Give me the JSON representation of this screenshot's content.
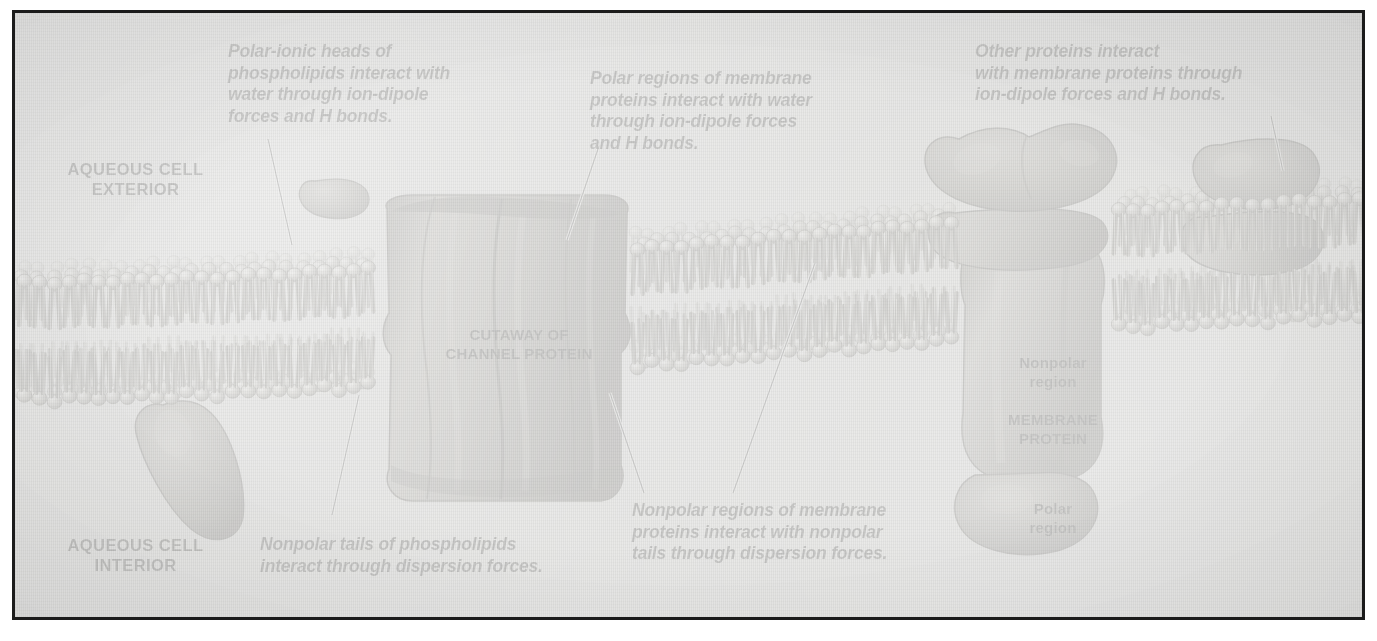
{
  "figure": {
    "background_color": "#e3e3e1",
    "frame_color": "#1b1b1b",
    "ink_color": "#0a0a0a"
  },
  "region_labels": {
    "exterior": "AQUEOUS CELL\nEXTERIOR",
    "interior": "AQUEOUS CELL\nINTERIOR"
  },
  "structure_labels": {
    "channel_protein": "CUTAWAY OF\nCHANNEL PROTEIN",
    "membrane_protein": "MEMBRANE\nPROTEIN",
    "nonpolar_region": "Nonpolar\nregion",
    "polar_region": "Polar\nregion"
  },
  "captions": [
    {
      "id": "polar-ionic-heads",
      "text": "Polar-ionic heads of\nphospholipids interact with\nwater through ion-dipole\nforces and H bonds."
    },
    {
      "id": "polar-regions-proteins",
      "text": "Polar regions of membrane\nproteins interact with water\nthrough ion-dipole forces\nand H bonds."
    },
    {
      "id": "other-proteins",
      "text": "Other proteins interact\nwith membrane proteins through\nion-dipole forces and H bonds."
    },
    {
      "id": "nonpolar-tails",
      "text": "Nonpolar tails of phospholipids\ninteract through dispersion forces."
    },
    {
      "id": "nonpolar-regions-proteins",
      "text": "Nonpolar regions of membrane\nproteins interact with nonpolar\ntails through dispersion forces."
    }
  ]
}
